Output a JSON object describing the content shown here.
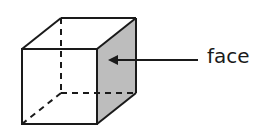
{
  "diagram": {
    "label": "face",
    "highlighted_face": "right side face",
    "colors": {
      "stroke": "#1a1a1a",
      "face_fill": "#bdbdbd",
      "background": "#ffffff"
    }
  }
}
